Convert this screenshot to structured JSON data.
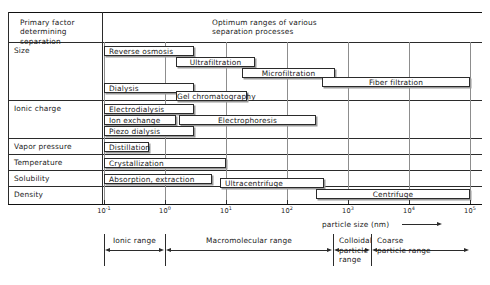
{
  "header": {
    "left_label": "Primary factor\ndetermining separation",
    "right_note": "Optimum ranges of various\nseparation processes"
  },
  "row_labels": [
    "Size",
    "Ionic charge",
    "Vapor pressure",
    "Temperature",
    "Solubility",
    "Density"
  ],
  "chart_data": {
    "type": "bar",
    "title": "Optimum ranges of various separation processes",
    "xlabel": "particle size (nm)",
    "ylabel": "",
    "xscale": "log",
    "xlim": [
      0.1,
      100000
    ],
    "grid": true,
    "legend": "none",
    "tick_labels": [
      "10⁻¹",
      "10⁰",
      "10¹",
      "10²",
      "10³",
      "10⁴",
      "10⁵"
    ],
    "tick_mantissa": [
      "10",
      "10",
      "10",
      "10",
      "10",
      "10",
      "10"
    ],
    "tick_exponents": [
      "-1",
      "0",
      "1",
      "2",
      "3",
      "4",
      "5"
    ],
    "tick_values": [
      0.1,
      1,
      10,
      100,
      1000,
      10000,
      100000
    ],
    "categories": [
      "Reverse osmosis",
      "Ultrafiltration",
      "Microfiltration",
      "Fiber filtration",
      "Dialysis",
      "Gel chromatography",
      "Electrodialysis",
      "Ion exchange",
      "Electrophoresis",
      "Piezo dialysis",
      "Distillation",
      "Crystallization",
      "Absorption, extraction",
      "Ultracentrifuge",
      "Centrifuge"
    ],
    "bars": [
      {
        "label": "Reverse osmosis",
        "factor": "Size",
        "x_start": 0.1,
        "x_end": 3.0
      },
      {
        "label": "Ultrafiltration",
        "factor": "Size",
        "x_start": 1.5,
        "x_end": 30.0
      },
      {
        "label": "Microfiltration",
        "factor": "Size",
        "x_start": 18.0,
        "x_end": 600.0
      },
      {
        "label": "Fiber filtration",
        "factor": "Size",
        "x_start": 380.0,
        "x_end": 100000.0
      },
      {
        "label": "Dialysis",
        "factor": "Size",
        "x_start": 0.1,
        "x_end": 3.0
      },
      {
        "label": "Gel chromatography",
        "factor": "Size",
        "x_start": 1.5,
        "x_end": 22.0
      },
      {
        "label": "Electrodialysis",
        "factor": "Ionic charge",
        "x_start": 0.1,
        "x_end": 3.0
      },
      {
        "label": "Ion exchange",
        "factor": "Ionic charge",
        "x_start": 0.1,
        "x_end": 1.5
      },
      {
        "label": "Electrophoresis",
        "factor": "Ionic charge",
        "x_start": 1.7,
        "x_end": 300.0
      },
      {
        "label": "Piezo dialysis",
        "factor": "Ionic charge",
        "x_start": 0.1,
        "x_end": 3.0
      },
      {
        "label": "Distillation",
        "factor": "Vapor pressure",
        "x_start": 0.1,
        "x_end": 0.55
      },
      {
        "label": "Crystallization",
        "factor": "Temperature",
        "x_start": 0.1,
        "x_end": 10.0
      },
      {
        "label": "Absorption, extraction",
        "factor": "Solubility",
        "x_start": 0.1,
        "x_end": 6.0
      },
      {
        "label": "Ultracentrifuge",
        "factor": "Density",
        "x_start": 8.0,
        "x_end": 400.0
      },
      {
        "label": "Centrifuge",
        "factor": "Density",
        "x_start": 300.0,
        "x_end": 100000.0
      }
    ]
  },
  "axis": {
    "title": "particle size (nm)"
  },
  "ranges": [
    {
      "label": "Ionic range",
      "x_start": 0.1,
      "x_end": 1.0
    },
    {
      "label": "Macromolecular range",
      "x_start": 1.0,
      "x_end": 560.0
    },
    {
      "label": "Colloidal\nparticle\nrange",
      "x_start": 560.0,
      "x_end": 2400.0
    },
    {
      "label": "Coarse\nparticle range",
      "x_start": 2400.0,
      "x_end": 100000.0
    }
  ]
}
